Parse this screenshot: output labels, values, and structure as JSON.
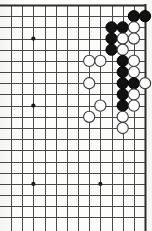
{
  "app": {
    "title": "Go Board Diagram",
    "kind": "go-board",
    "description": "Scanned black-and-white go (baduk/weiqi) board diagram showing the right side of a board with a dense fighting shape of black and white stones near the upper right corner."
  },
  "board": {
    "columns": 13,
    "rows": 20,
    "shows_top_edge": true,
    "shows_right_edge": true,
    "shows_left_edge": false,
    "shows_bottom_edge": false,
    "grid_color": "#4a4a4a",
    "border_color": "#2d2d2d",
    "background_color": "#fdfdfb",
    "line_width": 1,
    "border_width": 2,
    "origin_x": 11,
    "origin_y": 5,
    "pitch_x": 11.17,
    "pitch_y": 11.18,
    "stone_radius": 5.6
  },
  "star_points": [
    {
      "col": 2,
      "row": 3,
      "label": "star-point-upper-left"
    },
    {
      "col": 2,
      "row": 9,
      "label": "star-point-middle-left"
    },
    {
      "col": 2,
      "row": 16,
      "label": "star-point-lower-left"
    },
    {
      "col": 8,
      "row": 16,
      "label": "star-point-lower-right"
    }
  ],
  "stones": [
    {
      "col": 11,
      "row": 1,
      "color": "black"
    },
    {
      "col": 12,
      "row": 1,
      "color": "black"
    },
    {
      "col": 9,
      "row": 2,
      "color": "black"
    },
    {
      "col": 10,
      "row": 2,
      "color": "black"
    },
    {
      "col": 11,
      "row": 2,
      "color": "white"
    },
    {
      "col": 9,
      "row": 3,
      "color": "black"
    },
    {
      "col": 10,
      "row": 3,
      "color": "white"
    },
    {
      "col": 11,
      "row": 3,
      "color": "white"
    },
    {
      "col": 9,
      "row": 4,
      "color": "black"
    },
    {
      "col": 10,
      "row": 4,
      "color": "white"
    },
    {
      "col": 7,
      "row": 5,
      "color": "white"
    },
    {
      "col": 8,
      "row": 5,
      "color": "white"
    },
    {
      "col": 10,
      "row": 5,
      "color": "black"
    },
    {
      "col": 11,
      "row": 5,
      "color": "white"
    },
    {
      "col": 10,
      "row": 6,
      "color": "black"
    },
    {
      "col": 11,
      "row": 6,
      "color": "white"
    },
    {
      "col": 7,
      "row": 7,
      "color": "white"
    },
    {
      "col": 10,
      "row": 7,
      "color": "black"
    },
    {
      "col": 11,
      "row": 7,
      "color": "black"
    },
    {
      "col": 12,
      "row": 7,
      "color": "white"
    },
    {
      "col": 10,
      "row": 8,
      "color": "black"
    },
    {
      "col": 11,
      "row": 8,
      "color": "white"
    },
    {
      "col": 8,
      "row": 9,
      "color": "white"
    },
    {
      "col": 10,
      "row": 9,
      "color": "black"
    },
    {
      "col": 11,
      "row": 9,
      "color": "white"
    },
    {
      "col": 7,
      "row": 10,
      "color": "white"
    },
    {
      "col": 10,
      "row": 10,
      "color": "white"
    },
    {
      "col": 10,
      "row": 11,
      "color": "white"
    }
  ],
  "counts": {
    "black_stones": 13,
    "white_stones": 15,
    "total_stones": 28
  },
  "colors": {
    "black_stone_fill": "#121212",
    "black_stone_edge": "#000000",
    "white_stone_fill": "#ffffff",
    "white_stone_edge": "#3a3a3a",
    "star_point": "#1c1c1c"
  }
}
